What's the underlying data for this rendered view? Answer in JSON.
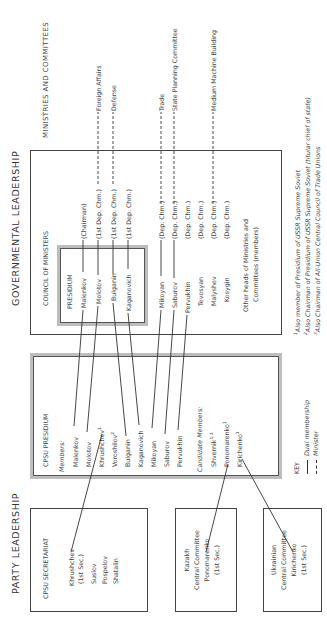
{
  "headers": {
    "party": "PARTY LEADERSHIP",
    "government": "GOVERNMENTAL LEADERSHIP",
    "ministries": "MINISTRIES AND COMMITTEES"
  },
  "council": {
    "title": "COUNCIL OF MINISTERS",
    "presidium_title": "PRESIDIUM",
    "members": [
      {
        "name": "Malenkov",
        "role": "(Chairman)"
      },
      {
        "name": "Molotov",
        "role": "(1st Dep. Chm.)"
      },
      {
        "name": "Bulganin",
        "role": "(1st Dep. Chm.)"
      },
      {
        "name": "Kaganovich",
        "role": "(1st Dep. Chm.)"
      },
      {
        "name": "Mikoyan",
        "role": "(Dep. Chm.)"
      },
      {
        "name": "Saburov",
        "role": "(Dep. Chm.)"
      },
      {
        "name": "Pervukhin",
        "role": "(Dep. Chm.)"
      },
      {
        "name": "Tevosyan",
        "role": "(Dep. Chm.)"
      },
      {
        "name": "Malyshev",
        "role": "(Dep. Chm.)"
      },
      {
        "name": "Kosygin",
        "role": "(Dep. Chm.)"
      }
    ],
    "other_heads_line1": "Other heads of Ministries and",
    "other_heads_line2": "Committees (members)"
  },
  "ministries": [
    {
      "label": "Foreign Affairs"
    },
    {
      "label": "Defense"
    },
    {
      "label": "Trade"
    },
    {
      "label": "State Planning Committee"
    },
    {
      "label": "Medium Machine Building"
    }
  ],
  "cpsu_presidium": {
    "title": "CPSU PRESIDIUM",
    "members_label": "Members:",
    "members": [
      "Malenkov",
      "Molotov",
      "Khrushchev",
      "Voroshilov",
      "Bulganin",
      "Kaganovich",
      "Mikoyan",
      "Saburov",
      "Pervukhin"
    ],
    "member_sups": [
      "",
      "",
      "1",
      "2",
      "",
      "",
      "",
      "",
      ""
    ],
    "candidates_label": "Candidate Members:",
    "candidates": [
      "Shvernik",
      "Ponomarenko",
      "Kirichenko"
    ],
    "candidate_sups": [
      "1,3",
      "1",
      "1"
    ]
  },
  "secretariat": {
    "title": "CPSU SECRETARIAT",
    "lines": [
      "Khrushchev",
      "(1st Sec.)",
      "Suslov",
      "Pospelov",
      "Shatalin"
    ]
  },
  "kazakh": {
    "lines": [
      "Kazakh",
      "Central Committee",
      "Ponomarenko",
      "(1st Sec.)"
    ]
  },
  "ukrainian": {
    "lines": [
      "Ukrainian",
      "Central Committee",
      "Kirichenko",
      "(1st Sec.)"
    ]
  },
  "key": {
    "title": "KEY",
    "solid": "Dual membership",
    "dashed": "Minister"
  },
  "footnotes": [
    {
      "mark": "1",
      "text": "Also member of Presidium of USSR Supreme Soviet"
    },
    {
      "mark": "2",
      "text": "Also Chairman of Presidium of USSR Supreme Soviet (titular chief of state)"
    },
    {
      "mark": "3",
      "text": "Also Chairman of All-Union Central Council of Trade Unions"
    }
  ]
}
